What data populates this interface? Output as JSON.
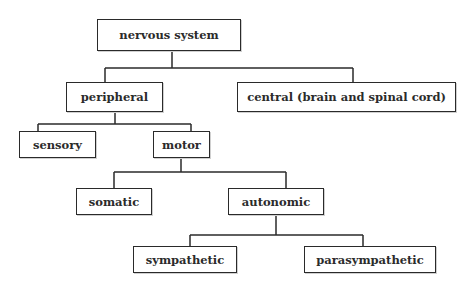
{
  "diagram": {
    "type": "tree",
    "title": "nervous system",
    "nodes": {
      "nervous_system": {
        "label": "nervous system",
        "box": [
          97,
          19,
          144,
          32
        ]
      },
      "peripheral": {
        "label": "peripheral",
        "box": [
          66,
          82,
          97,
          30
        ]
      },
      "central": {
        "label": "central (brain and spinal cord)",
        "box": [
          237,
          82,
          219,
          30
        ]
      },
      "sensory": {
        "label": "sensory",
        "box": [
          19,
          131,
          77,
          27
        ]
      },
      "motor": {
        "label": "motor",
        "box": [
          153,
          131,
          57,
          27
        ]
      },
      "somatic": {
        "label": "somatic",
        "box": [
          76,
          188,
          76,
          27
        ]
      },
      "autonomic": {
        "label": "autonomic",
        "box": [
          228,
          188,
          96,
          27
        ]
      },
      "sympathetic": {
        "label": "sympathetic",
        "box": [
          133,
          246,
          104,
          27
        ]
      },
      "parasympathetic": {
        "label": "parasympathetic",
        "box": [
          304,
          246,
          132,
          27
        ]
      }
    },
    "edges": [
      {
        "from": "nervous system",
        "to": "peripheral"
      },
      {
        "from": "nervous system",
        "to": "central (brain and spinal cord)"
      },
      {
        "from": "peripheral",
        "to": "sensory"
      },
      {
        "from": "peripheral",
        "to": "motor"
      },
      {
        "from": "motor",
        "to": "somatic"
      },
      {
        "from": "motor",
        "to": "autonomic"
      },
      {
        "from": "autonomic",
        "to": "sympathetic"
      },
      {
        "from": "autonomic",
        "to": "parasympathetic"
      }
    ],
    "colors": {
      "stroke": "#2a2a2a",
      "text": "#2b2b2b",
      "background": "#ffffff"
    }
  }
}
